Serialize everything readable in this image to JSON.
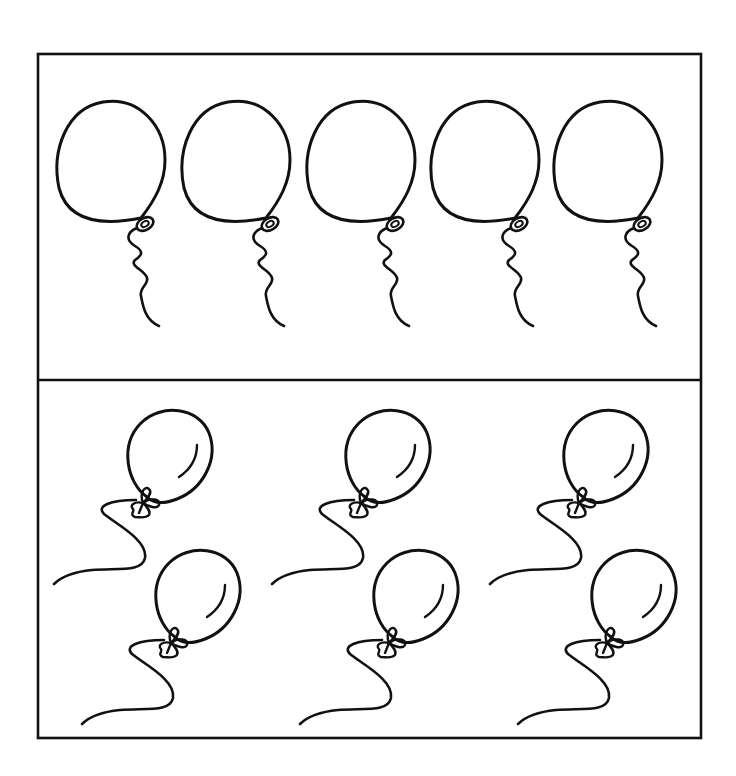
{
  "worksheet": {
    "frame": {
      "x": 38,
      "y": 54,
      "width": 663,
      "height": 684,
      "divider_y": 380
    },
    "colors": {
      "line": "#111111",
      "background": "#ffffff"
    },
    "top_panel": {
      "description": "Row of five round balloons with wavy strings",
      "count": 5,
      "balloon_centers_x": [
        111,
        236,
        361,
        485,
        608
      ],
      "balloon_center_y": 160
    },
    "bottom_panel": {
      "description": "Three pairs of tilted balloons with bow knots and curvy strings",
      "pair_count": 3,
      "pair_offsets_x": [
        0,
        218,
        436
      ],
      "balloons_per_pair": 2
    }
  }
}
